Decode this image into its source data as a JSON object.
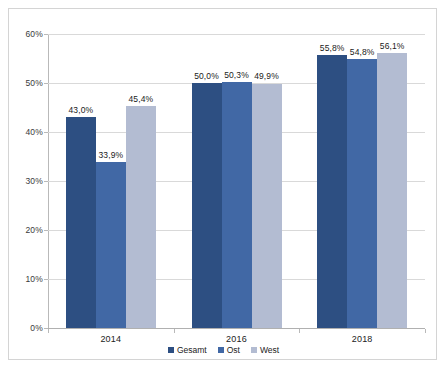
{
  "chart_data": {
    "type": "bar",
    "title": "",
    "subtitle": "",
    "xlabel": "",
    "ylabel": "",
    "categories": [
      "2014",
      "2016",
      "2018"
    ],
    "series": [
      {
        "name": "Gesamt",
        "color": "#2d4f82",
        "values": [
          43.0,
          50.0,
          55.8
        ],
        "labels": [
          "43,0%",
          "50,0%",
          "55,8%"
        ]
      },
      {
        "name": "Ost",
        "color": "#4168a5",
        "values": [
          33.9,
          50.3,
          54.8
        ],
        "labels": [
          "33,9%",
          "50,3%",
          "54,8%"
        ]
      },
      {
        "name": "West",
        "color": "#b3bcd2",
        "values": [
          45.4,
          49.9,
          56.1
        ],
        "labels": [
          "45,4%",
          "49,9%",
          "56,1%"
        ]
      }
    ],
    "ylim": [
      0,
      60
    ],
    "ytick_values": [
      0,
      10,
      20,
      30,
      40,
      50,
      60
    ],
    "ytick_labels": [
      "0%",
      "10%",
      "20%",
      "30%",
      "40%",
      "50%",
      "60%"
    ],
    "grid": true,
    "legend_position": "bottom",
    "legend_entries": [
      "Gesamt",
      "Ost",
      "West"
    ],
    "data_labels_shown": true,
    "border_color": "#d4d4d4",
    "gridline_color": "#d9d9d9",
    "background_color": "#ffffff"
  }
}
